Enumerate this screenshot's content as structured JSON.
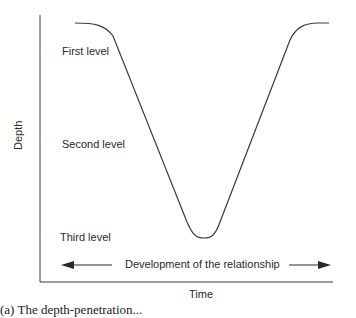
{
  "diagram": {
    "y_axis_label": "Depth",
    "x_axis_label": "Time",
    "levels": [
      {
        "label": "First level"
      },
      {
        "label": "Second level"
      },
      {
        "label": "Third level"
      }
    ],
    "arrow_label": "Development of the relationship",
    "caption": "(a) The depth-penetration... (caption partially visible)",
    "curve_description": "V-shaped curve descending from first level to third level and rising back"
  },
  "colors": {
    "line": "#3a3a3a",
    "text": "#2a2a2a",
    "background": "#ffffff"
  }
}
